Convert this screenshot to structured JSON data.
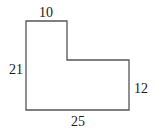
{
  "figure": {
    "type": "L-shaped polygon with dimension labels",
    "labels": {
      "top": "10",
      "left": "21",
      "right": "12",
      "bottom": "25"
    },
    "stroke_color": "#555555"
  }
}
